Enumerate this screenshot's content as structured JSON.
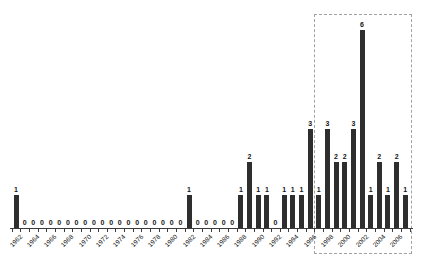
{
  "chart_data": {
    "type": "bar",
    "title": "",
    "xlabel": "",
    "ylabel": "",
    "x": [
      1962,
      1963,
      1964,
      1965,
      1966,
      1967,
      1968,
      1969,
      1970,
      1971,
      1972,
      1973,
      1974,
      1975,
      1976,
      1977,
      1978,
      1979,
      1980,
      1981,
      1982,
      1983,
      1984,
      1985,
      1986,
      1987,
      1988,
      1989,
      1990,
      1991,
      1992,
      1993,
      1994,
      1995,
      1996,
      1997,
      1998,
      1999,
      2000,
      2001,
      2002,
      2003,
      2004,
      2005,
      2006,
      2007
    ],
    "values": [
      1,
      0,
      0,
      0,
      0,
      0,
      0,
      0,
      0,
      0,
      0,
      0,
      0,
      0,
      0,
      0,
      0,
      0,
      0,
      0,
      1,
      0,
      0,
      0,
      0,
      0,
      1,
      2,
      1,
      1,
      0,
      1,
      1,
      1,
      3,
      1,
      3,
      2,
      2,
      3,
      6,
      1,
      2,
      1,
      2,
      1
    ],
    "x_tick_labels": [
      "1962",
      "1964",
      "1966",
      "1968",
      "1970",
      "1972",
      "1974",
      "1976",
      "1978",
      "1980",
      "1982",
      "1984",
      "1986",
      "1988",
      "1990",
      "1992",
      "1994",
      "1996",
      "1998",
      "2000",
      "2002",
      "2004",
      "2006"
    ],
    "ylim": [
      0,
      6
    ],
    "value_labels_shown": true,
    "grid": false,
    "legend": false,
    "bar_color": "#2e2e2e",
    "axis_color": "#3c3c3c",
    "value_label_color": "#141414",
    "highlight_box": {
      "style": "dashed",
      "color": "#a3a3a3",
      "from_year": 1997,
      "to_year": 2007
    }
  }
}
